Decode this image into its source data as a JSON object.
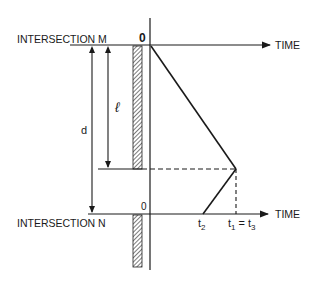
{
  "diagram": {
    "top_label": "INTERSECTION  M",
    "bottom_label": "INTERSECTION  N",
    "origin_top": "0",
    "origin_bottom": "0",
    "time_axis_top": "TIME",
    "time_axis_bottom": "TIME",
    "length_label": "ℓ",
    "distance_label": "d",
    "t2_label": "t",
    "t2_sub": "2",
    "t1_label": "t",
    "t1_sub": "1",
    "eq": " = t",
    "t3_sub": "3",
    "colors": {
      "line": "#1a1a1a",
      "background": "#ffffff"
    }
  }
}
